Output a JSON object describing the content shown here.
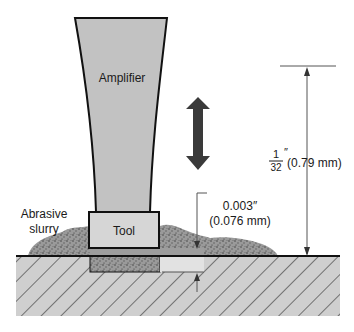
{
  "diagram": {
    "labels": {
      "amplifier": "Amplifier",
      "tool": "Tool",
      "abrasive_line1": "Abrasive",
      "abrasive_line2": "slurry",
      "gap_inch": "0.003″",
      "gap_mm": "(0.076 mm)",
      "amp_frac_num": "1",
      "amp_frac_den": "32",
      "amp_frac_unit": "″",
      "amp_mm": "(0.79 mm)"
    },
    "colors": {
      "amplifier_fill": "#c2c2c2",
      "tool_fill": "#d6d6d6",
      "workpiece_fill": "#cfcfcf",
      "arrow_fill": "#3a3a3a",
      "outline": "#111111",
      "slurry": "#8a8a8a"
    }
  }
}
